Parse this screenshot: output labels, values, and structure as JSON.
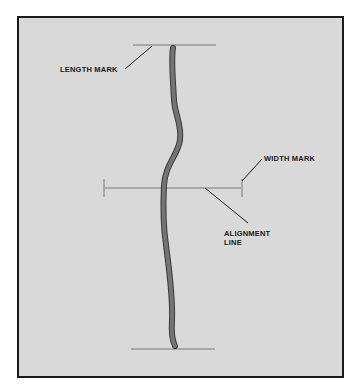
{
  "diagram": {
    "type": "hair-strand-measurement",
    "background_color": "#d9d9d9",
    "frame_color": "#1a1a1a",
    "strand_color": "#6e6e6e",
    "mark_color": "#a8a8a8",
    "labels": {
      "length_mark": "LENGTH MARK",
      "width_mark": "WIDTH MARK",
      "alignment_line_1": "ALIGNMENT",
      "alignment_line_2": "LINE"
    }
  }
}
